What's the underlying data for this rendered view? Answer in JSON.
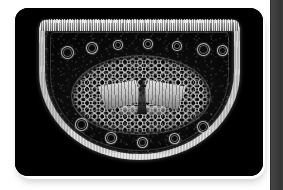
{
  "viewer": {
    "title": "Micrograph Viewer",
    "background_color": "#ffffff",
    "plate_color": "#000000",
    "accent_color": "#e8e8e8"
  },
  "image": {
    "caption": "",
    "modality": "dark-field light micrograph",
    "subject": "plant stem cross-section",
    "shape": "D-shaped semicircular transverse section",
    "background_color": "#000000",
    "highlight_color": "#f2f2f2"
  },
  "structures": {
    "epidermis_top_label": "",
    "epidermis_arc_label": "",
    "cortex_label": "",
    "stele_label": "",
    "xylem_label": "",
    "bundle_label": ""
  },
  "bundles": [
    {
      "left": 22,
      "top": 26,
      "size": 11
    },
    {
      "left": 47,
      "top": 22,
      "size": 10
    },
    {
      "left": 74,
      "top": 20,
      "size": 8
    },
    {
      "left": 104,
      "top": 19,
      "size": 8
    },
    {
      "left": 133,
      "top": 21,
      "size": 8
    },
    {
      "left": 158,
      "top": 23,
      "size": 11
    },
    {
      "left": 178,
      "top": 25,
      "size": 9
    },
    {
      "left": 36,
      "top": 98,
      "size": 11
    },
    {
      "left": 66,
      "top": 112,
      "size": 10
    },
    {
      "left": 98,
      "top": 117,
      "size": 9
    },
    {
      "left": 130,
      "top": 113,
      "size": 9
    },
    {
      "left": 158,
      "top": 101,
      "size": 10
    }
  ],
  "scrollbar": {
    "name": "vertical-scrollbar",
    "track_color": "#3a3a3a",
    "thumb_color": "#454545",
    "position": 0
  }
}
